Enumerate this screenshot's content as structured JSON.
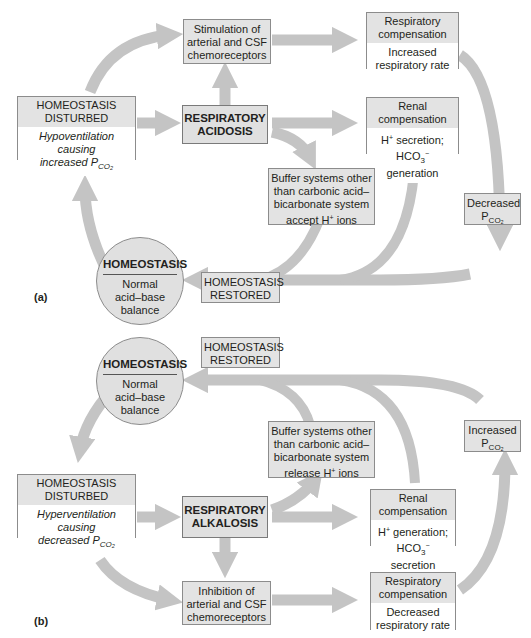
{
  "colors": {
    "arrow": "#c4c4c4",
    "box_fill": "#e3e3e3",
    "box_border": "#8c8c8c",
    "body_fill": "#ffffff"
  },
  "panel_a": {
    "label": "(a)",
    "disturbed": {
      "header": "HOMEOSTASIS DISTURBED",
      "body_line1": "Hypoventilation",
      "body_line2": "causing",
      "body_line3": "increased P",
      "body_sub": "CO₂"
    },
    "condition": {
      "line1": "RESPIRATORY",
      "line2": "ACIDOSIS"
    },
    "chemoreceptors": {
      "line1": "Stimulation of",
      "line2": "arterial and CSF",
      "line3": "chemoreceptors"
    },
    "respiratory_comp": {
      "header_line1": "Respiratory",
      "header_line2": "compensation",
      "body_line1": "Increased",
      "body_line2": "respiratory rate"
    },
    "renal_comp": {
      "header_line1": "Renal",
      "header_line2": "compensation",
      "body_line1a": "H",
      "body_line1sup": "+",
      "body_line1b": " secretion;",
      "body_line2a": "HCO",
      "body_line2sub": "3",
      "body_line2sup": "−",
      "body_line2b": " generation"
    },
    "buffer": {
      "line1": "Buffer systems other",
      "line2": "than carbonic acid–",
      "line3": "bicarbonate system",
      "line4a": "accept H",
      "line4sup": "+",
      "line4b": " ions"
    },
    "pco2": {
      "line1": "Decreased",
      "line2": "P",
      "line2sub": "CO₂"
    },
    "homeostasis": {
      "title": "HOMEOSTASIS",
      "line1": "Normal",
      "line2": "acid–base",
      "line3": "balance"
    },
    "restored": {
      "line1": "HOMEOSTASIS",
      "line2": "RESTORED"
    }
  },
  "panel_b": {
    "label": "(b)",
    "disturbed": {
      "header": "HOMEOSTASIS DISTURBED",
      "body_line1": "Hyperventilation",
      "body_line2": "causing",
      "body_line3": "decreased P",
      "body_sub": "CO₂"
    },
    "condition": {
      "line1": "RESPIRATORY",
      "line2": "ALKALOSIS"
    },
    "chemoreceptors": {
      "line1": "Inhibition of",
      "line2": "arterial and CSF",
      "line3": "chemoreceptors"
    },
    "respiratory_comp": {
      "header_line1": "Respiratory",
      "header_line2": "compensation",
      "body_line1": "Decreased",
      "body_line2": "respiratory rate"
    },
    "renal_comp": {
      "header_line1": "Renal",
      "header_line2": "compensation",
      "body_line1a": "H",
      "body_line1sup": "+",
      "body_line1b": " generation;",
      "body_line2a": "HCO",
      "body_line2sub": "3",
      "body_line2sup": "−",
      "body_line2b": " secretion"
    },
    "buffer": {
      "line1": "Buffer systems other",
      "line2": "than carbonic acid–",
      "line3": "bicarbonate system",
      "line4a": "release H",
      "line4sup": "+",
      "line4b": " ions"
    },
    "pco2": {
      "line1": "Increased",
      "line2": "P",
      "line2sub": "CO₂"
    },
    "homeostasis": {
      "title": "HOMEOSTASIS",
      "line1": "Normal",
      "line2": "acid–base",
      "line3": "balance"
    },
    "restored": {
      "line1": "HOMEOSTASIS",
      "line2": "RESTORED"
    }
  }
}
